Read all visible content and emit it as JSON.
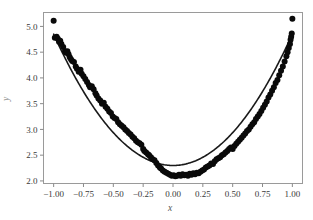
{
  "figure": {
    "background_color": "#ffffff",
    "axes_frame_color": "#9a9a9a",
    "tick_color": "#8a8a8a",
    "point_color": "#0a0a0a",
    "curve_color": "#1a1a1a"
  },
  "chart_data": {
    "type": "scatter",
    "title": "",
    "xlabel": "x",
    "ylabel": "y",
    "xlim": [
      -1.085,
      1.085
    ],
    "ylim": [
      1.95,
      5.27
    ],
    "grid": false,
    "legend": null,
    "xticks": [
      -1.0,
      -0.75,
      -0.5,
      -0.25,
      0.0,
      0.25,
      0.5,
      0.75,
      1.0
    ],
    "xticklabels": [
      "−1.00",
      "−0.75",
      "−0.50",
      "−0.25",
      "0.00",
      "0.25",
      "0.50",
      "0.75",
      "1.00"
    ],
    "yticks": [
      2.0,
      2.5,
      3.0,
      3.5,
      4.0,
      4.5,
      5.0
    ],
    "yticklabels": [
      "2.0",
      "2.5",
      "3.0",
      "3.5",
      "4.0",
      "4.5",
      "5.0"
    ],
    "series": [
      {
        "name": "observations",
        "type": "scatter",
        "marker": "circle",
        "marker_size": 4.2,
        "color": "#0a0a0a",
        "x": [
          -1.0,
          -0.99,
          -0.975,
          -0.965,
          -0.955,
          -0.945,
          -0.935,
          -0.92,
          -0.905,
          -0.895,
          -0.885,
          -0.875,
          -0.865,
          -0.855,
          -0.845,
          -0.83,
          -0.815,
          -0.805,
          -0.79,
          -0.775,
          -0.765,
          -0.75,
          -0.735,
          -0.72,
          -0.705,
          -0.695,
          -0.68,
          -0.665,
          -0.65,
          -0.64,
          -0.625,
          -0.61,
          -0.595,
          -0.58,
          -0.565,
          -0.55,
          -0.535,
          -0.52,
          -0.505,
          -0.49,
          -0.475,
          -0.46,
          -0.445,
          -0.43,
          -0.415,
          -0.4,
          -0.385,
          -0.37,
          -0.355,
          -0.34,
          -0.325,
          -0.31,
          -0.295,
          -0.28,
          -0.265,
          -0.25,
          -0.24,
          -0.225,
          -0.21,
          -0.2,
          -0.185,
          -0.17,
          -0.155,
          -0.14,
          -0.125,
          -0.11,
          -0.1,
          -0.085,
          -0.07,
          -0.055,
          -0.04,
          -0.025,
          -0.01,
          0.005,
          0.02,
          0.035,
          0.05,
          0.065,
          0.08,
          0.095,
          0.11,
          0.125,
          0.14,
          0.155,
          0.17,
          0.185,
          0.2,
          0.215,
          0.23,
          0.245,
          0.26,
          0.275,
          0.29,
          0.305,
          0.32,
          0.335,
          0.35,
          0.365,
          0.38,
          0.395,
          0.41,
          0.425,
          0.44,
          0.455,
          0.47,
          0.485,
          0.5,
          0.515,
          0.53,
          0.545,
          0.56,
          0.575,
          0.59,
          0.605,
          0.62,
          0.635,
          0.65,
          0.665,
          0.68,
          0.695,
          0.71,
          0.725,
          0.74,
          0.755,
          0.77,
          0.785,
          0.8,
          0.815,
          0.83,
          0.845,
          0.86,
          0.875,
          0.89,
          0.905,
          0.92,
          0.935,
          0.95,
          0.96,
          0.97,
          0.98,
          0.985,
          0.99,
          0.995,
          1.0
        ],
        "y": [
          5.11,
          4.78,
          4.8,
          4.76,
          4.7,
          4.72,
          4.66,
          4.6,
          4.52,
          4.49,
          4.52,
          4.46,
          4.4,
          4.36,
          4.33,
          4.31,
          4.22,
          4.18,
          4.12,
          4.16,
          4.08,
          4.03,
          3.98,
          3.92,
          3.86,
          3.82,
          3.84,
          3.78,
          3.7,
          3.66,
          3.6,
          3.56,
          3.5,
          3.52,
          3.44,
          3.4,
          3.35,
          3.32,
          3.25,
          3.22,
          3.2,
          3.14,
          3.1,
          3.07,
          3.04,
          3.0,
          2.97,
          2.93,
          2.9,
          2.86,
          2.83,
          2.78,
          2.75,
          2.73,
          2.7,
          2.62,
          2.58,
          2.55,
          2.52,
          2.5,
          2.46,
          2.42,
          2.4,
          2.35,
          2.3,
          2.26,
          2.24,
          2.2,
          2.18,
          2.16,
          2.14,
          2.12,
          2.1,
          2.11,
          2.09,
          2.1,
          2.12,
          2.1,
          2.13,
          2.11,
          2.12,
          2.1,
          2.14,
          2.12,
          2.15,
          2.13,
          2.16,
          2.15,
          2.18,
          2.2,
          2.22,
          2.26,
          2.28,
          2.3,
          2.34,
          2.33,
          2.38,
          2.42,
          2.44,
          2.46,
          2.5,
          2.52,
          2.55,
          2.58,
          2.62,
          2.65,
          2.62,
          2.68,
          2.72,
          2.76,
          2.8,
          2.84,
          2.88,
          2.92,
          2.97,
          3.0,
          3.05,
          3.1,
          3.14,
          3.2,
          3.25,
          3.3,
          3.36,
          3.42,
          3.48,
          3.54,
          3.62,
          3.68,
          3.75,
          3.82,
          3.9,
          3.96,
          4.05,
          4.14,
          4.22,
          4.32,
          4.42,
          4.5,
          4.58,
          4.66,
          4.74,
          4.8,
          4.86,
          5.15
        ]
      },
      {
        "name": "fitted-curve",
        "type": "line",
        "color": "#1a1a1a",
        "linewidth": 1.6,
        "equation": "y = 2.30 + 2.55 x^2",
        "intercept": 2.3,
        "quadratic_coefficient": 2.55,
        "x_range": [
          -1.0,
          1.0
        ]
      }
    ]
  }
}
